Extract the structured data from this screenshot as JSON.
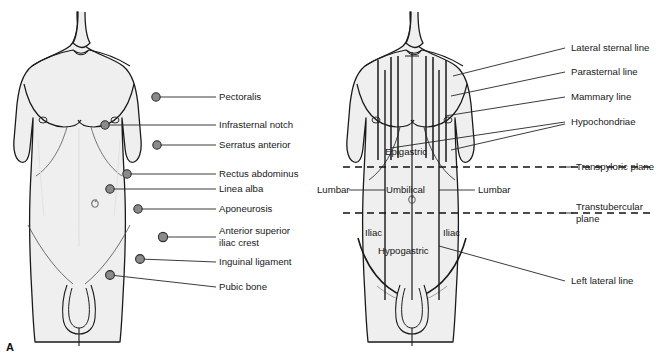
{
  "figure": {
    "background_color": "#ffffff",
    "body_fill": "#efefef",
    "outline_color": "#1a1a1a",
    "marker_fill": "#8a8a8a",
    "marker_stroke": "#2b2b2b"
  },
  "panel_a": {
    "letter": "A",
    "caption": "Anterior abdominal wall muscular and bony landmarks",
    "labels": [
      {
        "text": "Pectoralis",
        "lines": [
          "Pectoralis"
        ]
      },
      {
        "text": "Infrasternal notch",
        "lines": [
          "Infrasternal notch"
        ]
      },
      {
        "text": "Serratus anterior",
        "lines": [
          "Serratus anterior"
        ]
      },
      {
        "text": "Rectus abdominus",
        "lines": [
          "Rectus abdominus"
        ]
      },
      {
        "text": "Linea alba",
        "lines": [
          "Linea alba"
        ]
      },
      {
        "text": "Aponeurosis",
        "lines": [
          "Aponeurosis"
        ]
      },
      {
        "text": "Anterior superior iliac crest",
        "lines": [
          "Anterior superior",
          "iliac crest"
        ]
      },
      {
        "text": "Inguinal ligament",
        "lines": [
          "Inguinal ligament"
        ]
      },
      {
        "text": "Pubic bone",
        "lines": [
          "Pubic bone"
        ]
      }
    ]
  },
  "panel_b": {
    "letter": "B",
    "caption": "Abdominal regions and vertical/horizontal reference lines",
    "line_labels": [
      {
        "text": "Lateral sternal line"
      },
      {
        "text": "Parasternal line"
      },
      {
        "text": "Mammary line"
      },
      {
        "text": "Hypochondriae"
      },
      {
        "text": "Transpyloric plane"
      },
      {
        "text": "Transtubercular plane",
        "lines": [
          "Transtubercular",
          "plane"
        ]
      },
      {
        "text": "Left lateral line"
      }
    ],
    "region_labels": [
      {
        "text": "Epigastric"
      },
      {
        "text": "Lumbar"
      },
      {
        "text": "Umbilical"
      },
      {
        "text": "Lumbar"
      },
      {
        "text": "Iliac"
      },
      {
        "text": "Iliac"
      },
      {
        "text": "Hypogastric"
      }
    ]
  }
}
